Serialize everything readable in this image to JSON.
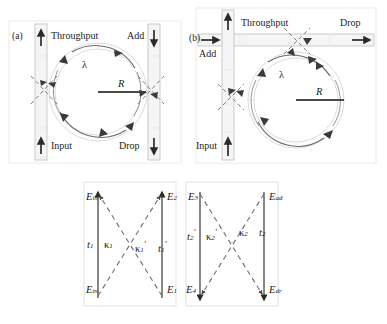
{
  "figure": {
    "type": "optical-microring-resonator-schematic",
    "panels": [
      {
        "id": "a",
        "tag": "(a)",
        "layout": "vertical-bus-waveguides",
        "ring_label": "R",
        "wavelength_label": "λ",
        "ports": [
          {
            "name": "throughput",
            "label": "Throughput",
            "arrow": "up",
            "position": "top-left"
          },
          {
            "name": "add",
            "label": "Add",
            "arrow": "down",
            "position": "top-right"
          },
          {
            "name": "input",
            "label": "Input",
            "arrow": "up",
            "position": "bottom-left"
          },
          {
            "name": "drop",
            "label": "Drop",
            "arrow": "down",
            "position": "bottom-right"
          }
        ]
      },
      {
        "id": "b",
        "tag": "(b)",
        "layout": "orthogonal-bus-waveguides",
        "ring_label": "R",
        "wavelength_label": "λ",
        "ports": [
          {
            "name": "throughput",
            "label": "Throughput",
            "arrow": "up",
            "position": "top-middle"
          },
          {
            "name": "drop",
            "label": "Drop",
            "arrow": "right",
            "position": "top-right"
          },
          {
            "name": "add",
            "label": "Add",
            "arrow": "right",
            "position": "left-upper"
          },
          {
            "name": "input",
            "label": "Input",
            "arrow": "up",
            "position": "bottom-left"
          }
        ]
      },
      {
        "id": "c-left",
        "layout": "coupling-matrix-left",
        "fields": [
          {
            "name": "e-th",
            "base": "E",
            "sub": "th",
            "prime": "",
            "position": "top-left"
          },
          {
            "name": "e-2",
            "base": "E",
            "sub": "2",
            "prime": "",
            "position": "top-right"
          },
          {
            "name": "e-in",
            "base": "E",
            "sub": "in",
            "prime": "",
            "position": "bottom-left"
          },
          {
            "name": "e-1",
            "base": "E",
            "sub": "1",
            "prime": "",
            "position": "bottom-right"
          }
        ],
        "coefficients": [
          {
            "name": "t1",
            "base": "t",
            "sub": "1",
            "prime": ""
          },
          {
            "name": "kappa1",
            "base": "κ",
            "sub": "1",
            "prime": ""
          },
          {
            "name": "kappa1p",
            "base": "κ",
            "sub": "1",
            "prime": "′"
          },
          {
            "name": "t1p",
            "base": "t",
            "sub": "1",
            "prime": "′"
          }
        ]
      },
      {
        "id": "c-right",
        "layout": "coupling-matrix-right",
        "fields": [
          {
            "name": "e-3",
            "base": "E",
            "sub": "3",
            "prime": "",
            "position": "top-left"
          },
          {
            "name": "e-ad",
            "base": "E",
            "sub": "ad",
            "prime": "",
            "position": "top-right"
          },
          {
            "name": "e-4",
            "base": "E",
            "sub": "4",
            "prime": "",
            "position": "bottom-left"
          },
          {
            "name": "e-dr",
            "base": "E",
            "sub": "dr",
            "prime": "",
            "position": "bottom-right"
          }
        ],
        "coefficients": [
          {
            "name": "t2p",
            "base": "t",
            "sub": "2",
            "prime": "′"
          },
          {
            "name": "kappa2p",
            "base": "κ",
            "sub": "2",
            "prime": "′"
          },
          {
            "name": "kappa2",
            "base": "κ",
            "sub": "2",
            "prime": ""
          },
          {
            "name": "t2",
            "base": "t",
            "sub": "2",
            "prime": ""
          }
        ]
      }
    ],
    "colors": {
      "background": "#ffffff",
      "ink": "#1b1b1b",
      "waveguide_fill": "#f4f4f4",
      "waveguide_stroke": "#b8b8b8",
      "ring_stroke": "#8c8c8c",
      "ring_inner_stroke": "#cfcfcf",
      "dashed_stroke": "#6f6f6f",
      "panel_border": "#d8d8d8",
      "solid_line": "#555555"
    },
    "labels": {
      "panel_a_tag": "(a)",
      "panel_b_tag": "(b)",
      "throughput": "Throughput",
      "add": "Add",
      "input": "Input",
      "drop": "Drop",
      "radius": "R",
      "lambda": "λ"
    }
  }
}
